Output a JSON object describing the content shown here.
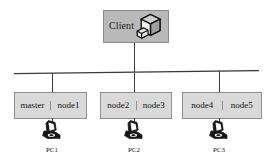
{
  "diagram": {
    "background_color": "#ffffff",
    "client": {
      "label": "Client",
      "icon": "cube-3d-icon",
      "fill_color": "#b9b9b9",
      "border_color": "#8a8a8a"
    },
    "bus": {
      "name": "network-bus-line",
      "color": "#3a3a3a"
    },
    "groups": [
      {
        "id": "group-1",
        "cells": [
          "master",
          "node1"
        ],
        "pc": {
          "label": "PC1",
          "icon": "desktop-computer-icon"
        }
      },
      {
        "id": "group-2",
        "cells": [
          "node2",
          "node3"
        ],
        "pc": {
          "label": "PC2",
          "icon": "desktop-computer-icon"
        }
      },
      {
        "id": "group-3",
        "cells": [
          "node4",
          "node5"
        ],
        "pc": {
          "label": "PC3",
          "icon": "desktop-computer-icon"
        }
      }
    ],
    "colors": {
      "node_fill": "#d9d9d9",
      "node_border": "#8f8f8f",
      "line": "#3a3a3a",
      "icon": "#1c1c1c"
    }
  }
}
